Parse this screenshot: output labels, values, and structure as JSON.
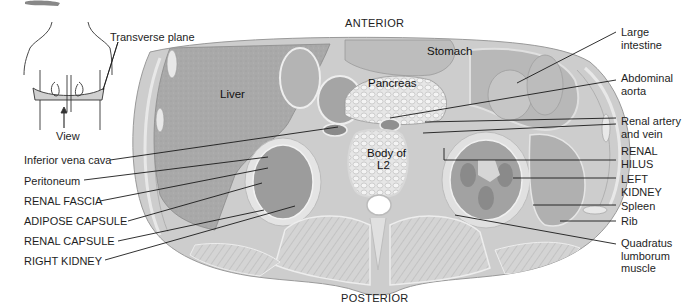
{
  "orientation": {
    "top": "ANTERIOR",
    "bottom": "POSTERIOR"
  },
  "inset": {
    "plane_label": "Transverse plane",
    "view_label": "View"
  },
  "organ_labels": {
    "liver": "Liver",
    "stomach": "Stomach",
    "pancreas": "Pancreas",
    "vertebra_line1": "Body of",
    "vertebra_line2": "L2"
  },
  "left_labels": [
    {
      "text": "Inferior vena cava"
    },
    {
      "text": "Peritoneum"
    },
    {
      "text": "RENAL FASCIA"
    },
    {
      "text": "ADIPOSE CAPSULE"
    },
    {
      "text": "RENAL CAPSULE"
    },
    {
      "text": "RIGHT KIDNEY"
    }
  ],
  "right_labels": [
    {
      "line1": "Large",
      "line2": "intestine"
    },
    {
      "line1": "Abdominal",
      "line2": "aorta"
    },
    {
      "line1": "Renal artery",
      "line2": "and vein"
    },
    {
      "line1": "RENAL",
      "line2": "HILUS"
    },
    {
      "line1": "LEFT",
      "line2": "KIDNEY"
    },
    {
      "line1": "Spleen"
    },
    {
      "line1": "Rib"
    },
    {
      "line1": "Quadratus",
      "line2": "lumborum",
      "line3": "muscle"
    }
  ],
  "colors": {
    "tissue_base": "#c9c9c9",
    "liver": "#a8a8a8",
    "kidney": "#9a9a9a",
    "muscle": "#cfcfcf",
    "leader_line": "#1a1a1a"
  }
}
